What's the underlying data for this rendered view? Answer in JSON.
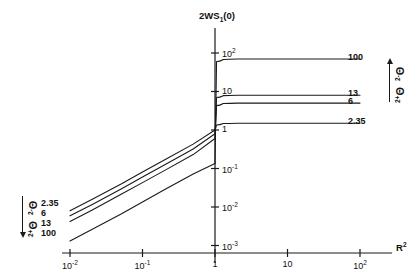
{
  "figure": {
    "background": "#ffffff",
    "line_color": "#1a1a1a"
  },
  "axes": {
    "y_title": "2WS",
    "y_title_sub": "1",
    "y_title_tail": "(0)",
    "x_title": "R",
    "x_title_sup": "2",
    "x_ticks": [
      {
        "mant": "10",
        "exp": "-2",
        "value": 0.01
      },
      {
        "mant": "10",
        "exp": "-1",
        "value": 0.1
      },
      {
        "mant": "1",
        "exp": "",
        "value": 1
      },
      {
        "mant": "10",
        "exp": "",
        "value": 10
      },
      {
        "mant": "10",
        "exp": "2",
        "value": 100
      }
    ],
    "y_ticks": [
      {
        "mant": "10",
        "exp": "2",
        "value": 100
      },
      {
        "mant": "10",
        "exp": "",
        "value": 10
      },
      {
        "mant": "1",
        "exp": "",
        "value": 1
      },
      {
        "mant": "10",
        "exp": "-1",
        "value": 0.1
      },
      {
        "mant": "10",
        "exp": "-2",
        "value": 0.01
      },
      {
        "mant": "10",
        "exp": "-3",
        "value": 0.001
      }
    ]
  },
  "annotations": {
    "right": {
      "top_symbol": "Θ",
      "top_sup": "2-",
      "bottom_symbol": "Θ",
      "bottom_sup": "2+",
      "arrow": "up"
    },
    "left": {
      "top_symbol": "Θ",
      "top_sup": "2-",
      "bottom_symbol": "Θ",
      "bottom_sup": "2+",
      "arrow": "down"
    }
  },
  "chart_data": {
    "type": "line",
    "title": "",
    "xlabel": "R^2",
    "ylabel": "2WS_1(0)",
    "xscale": "log",
    "yscale": "log",
    "xlim": [
      0.01,
      100
    ],
    "ylim": [
      0.001,
      200
    ],
    "grid": false,
    "legend": "curve-end-labels",
    "series": [
      {
        "name": "100",
        "right_label": "100",
        "left_label": "100",
        "plateau": 70,
        "x": [
          0.01,
          0.02,
          0.05,
          0.1,
          0.2,
          0.5,
          1.0,
          1.05,
          1.3,
          2,
          5,
          10,
          100
        ],
        "y": [
          0.0013,
          0.0026,
          0.0065,
          0.0135,
          0.028,
          0.072,
          0.135,
          60,
          68,
          70,
          70,
          70,
          70
        ]
      },
      {
        "name": "13",
        "right_label": "13",
        "left_label": "13",
        "plateau": 8.0,
        "x": [
          0.01,
          0.02,
          0.05,
          0.1,
          0.2,
          0.5,
          1.0,
          1.05,
          1.3,
          2,
          5,
          10,
          100
        ],
        "y": [
          0.0042,
          0.0082,
          0.021,
          0.043,
          0.088,
          0.23,
          0.6,
          7.0,
          7.8,
          8.0,
          8.0,
          8.0,
          8.0
        ]
      },
      {
        "name": "6",
        "right_label": "6",
        "left_label": "6",
        "plateau": 5.0,
        "x": [
          0.01,
          0.02,
          0.05,
          0.1,
          0.2,
          0.5,
          1.0,
          1.05,
          1.3,
          2,
          5,
          10,
          100
        ],
        "y": [
          0.0059,
          0.0115,
          0.029,
          0.06,
          0.124,
          0.32,
          0.8,
          4.3,
          4.9,
          5.0,
          5.0,
          5.0,
          5.0
        ]
      },
      {
        "name": "2.35",
        "right_label": "2.35",
        "left_label": "2.35",
        "plateau": 1.5,
        "x": [
          0.01,
          0.02,
          0.05,
          0.1,
          0.2,
          0.5,
          1.0,
          1.05,
          1.3,
          2,
          5,
          10,
          100
        ],
        "y": [
          0.008,
          0.0156,
          0.039,
          0.081,
          0.167,
          0.43,
          1.0,
          1.35,
          1.48,
          1.5,
          1.5,
          1.5,
          1.5
        ]
      }
    ]
  }
}
